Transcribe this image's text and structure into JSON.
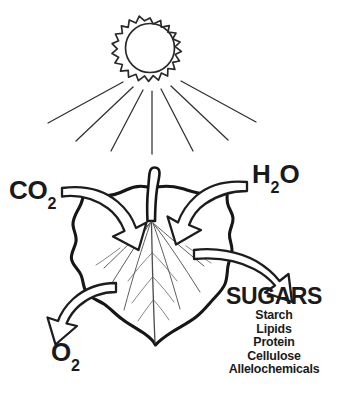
{
  "figure": {
    "background_color": "#ffffff",
    "ink_color": "#1a1a1a",
    "credit_color": "#8d8d8d"
  },
  "sun": {
    "name": "sun",
    "ray_points": 16,
    "light_beams": 7
  },
  "leaf": {
    "name": "leaf",
    "description": "heart-shaped lobed leaf with petiole and radiating veins"
  },
  "inputs": [
    {
      "key": "co2",
      "label_html": "CO",
      "subscript": "2",
      "direction": "into-leaf",
      "side": "left"
    },
    {
      "key": "h2o",
      "label_html": "H",
      "subscript": "2",
      "label_tail": "O",
      "direction": "into-leaf",
      "side": "right"
    }
  ],
  "labels": {
    "co2_main": "CO",
    "co2_sub": "2",
    "h2o_main": "H",
    "h2o_sub": "2",
    "h2o_tail": "O",
    "o2_main": "O",
    "o2_sub": "2"
  },
  "outputs": {
    "sugars_title": "SUGARS",
    "sugars_items": [
      "Starch",
      "Lipids",
      "Protein",
      "Cellulose",
      "Allelochemicals"
    ],
    "o2_label": "O2"
  },
  "credit": {
    "text": "International Society of Arboriculture",
    "orientation": "vertical-right-edge"
  }
}
